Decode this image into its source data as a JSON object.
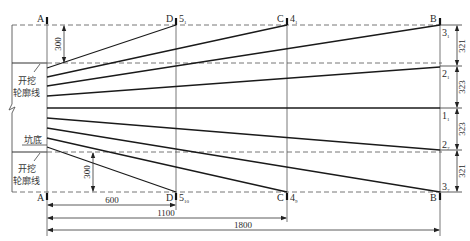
{
  "diagram": {
    "title": "",
    "points": {
      "A": "A",
      "B": "B",
      "C": "C",
      "D": "D"
    },
    "hole_labels_top": {
      "d": "5",
      "d_sub": "1",
      "c": "4",
      "c_sub": "1"
    },
    "hole_labels_bottom": {
      "d": "5",
      "d_sub": "10",
      "c": "4",
      "c_sub": "9"
    },
    "right_labels": [
      {
        "main": "3",
        "sub": "1"
      },
      {
        "main": "2",
        "sub": "1"
      },
      {
        "main": "1",
        "sub": "1"
      },
      {
        "main": "2",
        "sub": "7"
      },
      {
        "main": "3",
        "sub": "7"
      }
    ],
    "left_annotations": {
      "excavation_contour_top": "开挖\n轮廓线",
      "excavation_contour_top_line1": "开挖",
      "excavation_contour_top_line2": "轮廓线",
      "pit_bottom": "坑底",
      "excavation_contour_bottom_line1": "开挖",
      "excavation_contour_bottom_line2": "轮廓线"
    },
    "dimensions": {
      "left_top": "300",
      "left_bottom": "300",
      "bottom_600": "600",
      "bottom_1100": "1100",
      "bottom_1800": "1800",
      "right": [
        "321",
        "323",
        "323",
        "321"
      ]
    },
    "colors": {
      "line": "#1a1a1a",
      "dashed": "#555555",
      "thin": "#444444"
    }
  }
}
